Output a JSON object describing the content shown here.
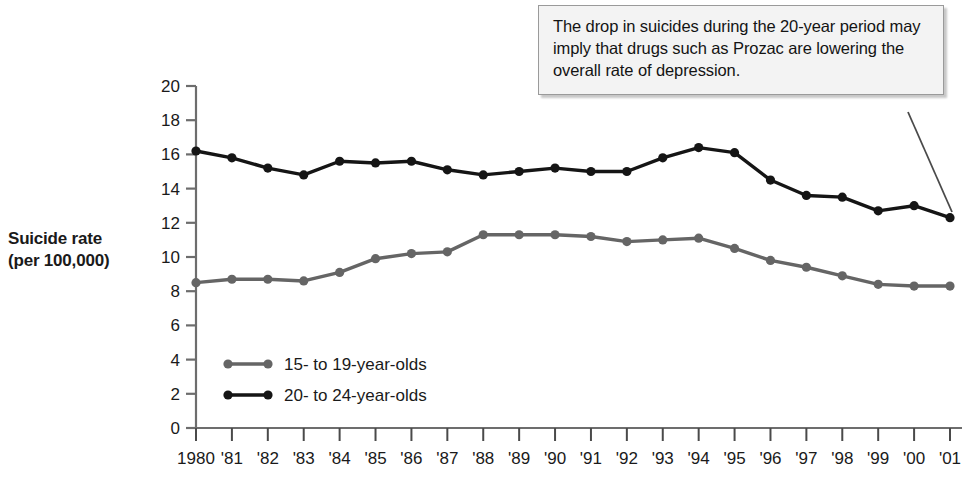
{
  "chart_data": {
    "type": "line",
    "title": "",
    "xlabel": "",
    "ylabel": "Suicide rate (per 100,000)",
    "ylabel_line1": "Suicide rate",
    "ylabel_line2": "(per 100,000)",
    "x": [
      1980,
      1981,
      1982,
      1983,
      1984,
      1985,
      1986,
      1987,
      1988,
      1989,
      1990,
      1991,
      1992,
      1993,
      1994,
      1995,
      1996,
      1997,
      1998,
      1999,
      2000,
      2001
    ],
    "categories": [
      "1980",
      "'81",
      "'82",
      "'83",
      "'84",
      "'85",
      "'86",
      "'87",
      "'88",
      "'89",
      "'90",
      "'91",
      "'92",
      "'93",
      "'94",
      "'95",
      "'96",
      "'97",
      "'98",
      "'99",
      "'00",
      "'01"
    ],
    "ylim": [
      0,
      20
    ],
    "yticks": [
      0,
      2,
      4,
      6,
      8,
      10,
      12,
      14,
      16,
      18,
      20
    ],
    "ytick_labels": [
      "0",
      "2",
      "4",
      "6",
      "8",
      "10",
      "12",
      "14",
      "16",
      "18",
      "20"
    ],
    "grid": false,
    "legend_position": "inside-lower-left",
    "series": [
      {
        "name": "15- to 19-year-olds",
        "color": "#656565",
        "marker": "circle",
        "values": [
          8.5,
          8.7,
          8.7,
          8.6,
          9.1,
          9.9,
          10.2,
          10.3,
          11.3,
          11.3,
          11.3,
          11.2,
          10.9,
          11.0,
          11.1,
          10.5,
          9.8,
          9.4,
          8.9,
          8.4,
          8.3,
          8.3
        ]
      },
      {
        "name": "20- to 24-year-olds",
        "color": "#151515",
        "marker": "circle",
        "values": [
          16.2,
          15.8,
          15.2,
          14.8,
          15.6,
          15.5,
          15.6,
          15.1,
          14.8,
          15.0,
          15.2,
          15.0,
          15.0,
          15.8,
          16.4,
          16.1,
          14.5,
          13.6,
          13.5,
          12.7,
          13.0,
          12.3
        ]
      }
    ],
    "annotations": [
      {
        "name": "prozac-callout",
        "text": "The drop in suicides during the 20-year period may imply that drugs such as Prozac are lowering the overall rate of depression.",
        "points_to": "2001"
      }
    ]
  },
  "legend": {
    "items": [
      {
        "label": "15- to 19-year-olds",
        "color": "#656565"
      },
      {
        "label": "20- to 24-year-olds",
        "color": "#151515"
      }
    ]
  },
  "colors": {
    "background": "#ffffff",
    "axis": "#6d6d6d",
    "text": "#1a1a1a",
    "callout_bg": "#f3f3f3",
    "callout_border": "#9a9a9a",
    "series_young": "#656565",
    "series_older": "#151515"
  }
}
